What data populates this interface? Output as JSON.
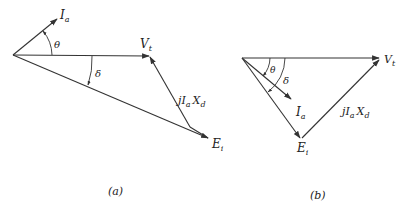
{
  "figure": {
    "panels": [
      {
        "id": "a",
        "caption": "(a)",
        "labels": {
          "current": "I",
          "current_sub": "a",
          "terminal_voltage": "V",
          "terminal_voltage_sub": "t",
          "internal_emf": "E",
          "internal_emf_sub": "i",
          "reactance_drop": "jI",
          "reactance_drop_sub1": "a",
          "reactance_drop_mid": "X",
          "reactance_drop_sub2": "d",
          "theta": "θ",
          "delta": "δ"
        }
      },
      {
        "id": "b",
        "caption": "(b)",
        "labels": {
          "current": "I",
          "current_sub": "a",
          "terminal_voltage": "V",
          "terminal_voltage_sub": "t",
          "internal_emf": "E",
          "internal_emf_sub": "i",
          "reactance_drop": "jI",
          "reactance_drop_sub1": "a",
          "reactance_drop_mid": "X",
          "reactance_drop_sub2": "d",
          "theta": "θ",
          "delta": "δ"
        }
      }
    ]
  }
}
